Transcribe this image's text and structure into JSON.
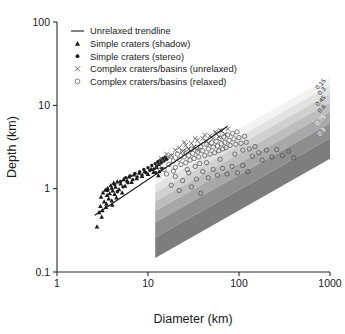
{
  "chart_data": {
    "type": "scatter",
    "title": "",
    "xlabel": "Diameter (km)",
    "ylabel": "Depth (km)",
    "xscale": "log",
    "yscale": "log",
    "xlim": [
      1,
      1000
    ],
    "ylim": [
      0.1,
      100
    ],
    "xticks": [
      "1",
      "10",
      "100",
      "1000"
    ],
    "yticks": [
      "0.1",
      "1",
      "10",
      "100"
    ],
    "grid": false,
    "legend_position": "top-left",
    "legend": [
      {
        "marker": "line",
        "label": "Unrelaxed trendline"
      },
      {
        "marker": "triangle",
        "label": "Simple craters (shadow)"
      },
      {
        "marker": "circle-fill",
        "label": "Simple craters (stereo)"
      },
      {
        "marker": "cross",
        "label": "Complex craters/basins (unrelaxed)"
      },
      {
        "marker": "circle-open",
        "label": "Complex craters/basins (relaxed)"
      }
    ],
    "band_labels": [
      "0.15",
      "0.3",
      "0.45",
      "0.6",
      "0.75",
      "0.9"
    ],
    "band_colors": [
      "#f2f2f2",
      "#e2e2e2",
      "#d0d0d0",
      "#bdbdbd",
      "#a8a8a8",
      "#8e8e8e",
      "#7d7d7d"
    ],
    "band_region": {
      "x_start": 12,
      "x_end": 1000,
      "note": "relaxation-state wedge"
    },
    "trendline": {
      "x": [
        2.6,
        75
      ],
      "y": [
        0.48,
        5.6
      ]
    },
    "series": [
      {
        "name": "Simple craters (shadow)",
        "marker": "triangle",
        "points": [
          [
            2.75,
            0.35
          ],
          [
            2.9,
            0.52
          ],
          [
            3.0,
            0.62
          ],
          [
            3.05,
            0.8
          ],
          [
            3.1,
            0.46
          ],
          [
            3.2,
            0.9
          ],
          [
            3.3,
            0.7
          ],
          [
            3.4,
            0.97
          ],
          [
            3.5,
            0.66
          ],
          [
            3.55,
            0.84
          ],
          [
            3.6,
            1.02
          ],
          [
            3.7,
            0.76
          ],
          [
            3.8,
            0.88
          ],
          [
            3.9,
            1.1
          ],
          [
            4.0,
            0.72
          ],
          [
            4.1,
            0.95
          ],
          [
            4.2,
            1.18
          ],
          [
            4.3,
            0.86
          ],
          [
            4.4,
            1.05
          ],
          [
            4.5,
            0.78
          ],
          [
            4.6,
            1.22
          ],
          [
            4.8,
            0.98
          ],
          [
            5.0,
            1.15
          ],
          [
            5.2,
            0.9
          ],
          [
            5.4,
            1.3
          ],
          [
            5.6,
            1.08
          ],
          [
            5.9,
            1.25
          ],
          [
            6.2,
            1.4
          ],
          [
            6.6,
            1.2
          ],
          [
            7.0,
            1.48
          ],
          [
            7.5,
            1.33
          ],
          [
            8.0,
            1.55
          ],
          [
            8.6,
            1.42
          ],
          [
            9.2,
            1.62
          ],
          [
            10.0,
            1.5
          ],
          [
            10.8,
            1.72
          ],
          [
            11.5,
            1.58
          ],
          [
            12.5,
            1.8
          ],
          [
            13.0,
            1.45
          ],
          [
            3.15,
            0.55
          ],
          [
            3.45,
            0.6
          ],
          [
            4.05,
            0.64
          ]
        ]
      },
      {
        "name": "Simple craters (stereo)",
        "marker": "circle-fill",
        "points": [
          [
            3.6,
            0.95
          ],
          [
            4.0,
            1.0
          ],
          [
            4.3,
            1.12
          ],
          [
            4.6,
            0.92
          ],
          [
            5.0,
            1.22
          ],
          [
            5.3,
            1.05
          ],
          [
            5.7,
            1.35
          ],
          [
            6.0,
            1.18
          ],
          [
            6.4,
            1.42
          ],
          [
            6.8,
            1.28
          ],
          [
            7.2,
            1.52
          ],
          [
            7.6,
            1.38
          ],
          [
            8.1,
            1.6
          ],
          [
            8.6,
            1.46
          ],
          [
            9.0,
            1.7
          ],
          [
            9.5,
            1.55
          ],
          [
            10.0,
            1.78
          ],
          [
            10.5,
            1.65
          ],
          [
            11.0,
            1.9
          ],
          [
            11.6,
            1.72
          ],
          [
            12.0,
            2.0
          ],
          [
            12.4,
            1.85
          ],
          [
            12.8,
            2.1
          ],
          [
            13.2,
            1.95
          ],
          [
            13.6,
            2.2
          ],
          [
            14.0,
            2.05
          ],
          [
            14.5,
            2.3
          ],
          [
            15.0,
            2.15
          ],
          [
            15.5,
            2.38
          ],
          [
            16.0,
            2.25
          ],
          [
            13.4,
            1.6
          ],
          [
            14.2,
            1.75
          ],
          [
            12.2,
            1.55
          ]
        ]
      },
      {
        "name": "Complex craters/basins (unrelaxed)",
        "marker": "cross",
        "points": [
          [
            14,
            2.3
          ],
          [
            16,
            2.6
          ],
          [
            18,
            2.5
          ],
          [
            20,
            2.9
          ],
          [
            22,
            3.1
          ],
          [
            24,
            2.8
          ],
          [
            26,
            3.3
          ],
          [
            28,
            3.0
          ],
          [
            30,
            3.5
          ],
          [
            32,
            3.2
          ],
          [
            35,
            3.8
          ],
          [
            38,
            3.4
          ],
          [
            40,
            4.0
          ],
          [
            44,
            3.7
          ],
          [
            48,
            4.3
          ],
          [
            52,
            4.0
          ],
          [
            56,
            4.6
          ],
          [
            60,
            4.2
          ],
          [
            65,
            4.9
          ],
          [
            70,
            4.5
          ],
          [
            75,
            5.2
          ],
          [
            25,
            3.6
          ],
          [
            33,
            4.0
          ],
          [
            42,
            4.4
          ],
          [
            55,
            4.8
          ],
          [
            62,
            5.0
          ],
          [
            36,
            2.9
          ],
          [
            46,
            3.5
          ]
        ]
      },
      {
        "name": "Complex craters/basins (relaxed)",
        "marker": "circle-open",
        "points": [
          [
            13,
            1.85
          ],
          [
            14,
            2.1
          ],
          [
            15,
            1.7
          ],
          [
            16,
            2.3
          ],
          [
            17,
            1.95
          ],
          [
            18,
            2.45
          ],
          [
            19,
            2.15
          ],
          [
            20,
            1.8
          ],
          [
            21,
            2.6
          ],
          [
            22,
            2.25
          ],
          [
            23,
            1.95
          ],
          [
            24,
            2.75
          ],
          [
            25,
            2.4
          ],
          [
            26,
            2.05
          ],
          [
            27,
            2.9
          ],
          [
            28,
            2.5
          ],
          [
            29,
            2.2
          ],
          [
            30,
            3.0
          ],
          [
            31,
            2.65
          ],
          [
            32,
            2.3
          ],
          [
            33,
            1.85
          ],
          [
            34,
            3.1
          ],
          [
            35,
            2.75
          ],
          [
            36,
            2.4
          ],
          [
            37,
            2.0
          ],
          [
            38,
            3.2
          ],
          [
            40,
            2.85
          ],
          [
            42,
            2.5
          ],
          [
            44,
            3.4
          ],
          [
            46,
            3.0
          ],
          [
            48,
            2.6
          ],
          [
            50,
            3.55
          ],
          [
            52,
            3.15
          ],
          [
            54,
            2.7
          ],
          [
            56,
            3.7
          ],
          [
            58,
            3.25
          ],
          [
            60,
            2.85
          ],
          [
            62,
            4.0
          ],
          [
            64,
            3.45
          ],
          [
            66,
            3.0
          ],
          [
            68,
            4.2
          ],
          [
            70,
            3.6
          ],
          [
            72,
            3.1
          ],
          [
            75,
            4.4
          ],
          [
            78,
            3.8
          ],
          [
            80,
            3.3
          ],
          [
            85,
            4.6
          ],
          [
            88,
            3.95
          ],
          [
            92,
            3.4
          ],
          [
            95,
            4.8
          ],
          [
            100,
            4.1
          ],
          [
            105,
            3.5
          ],
          [
            110,
            2.9
          ],
          [
            115,
            4.25
          ],
          [
            120,
            3.6
          ],
          [
            130,
            3.0
          ],
          [
            140,
            2.45
          ],
          [
            150,
            3.2
          ],
          [
            165,
            2.7
          ],
          [
            180,
            2.2
          ],
          [
            200,
            2.9
          ],
          [
            230,
            2.4
          ],
          [
            260,
            2.95
          ],
          [
            300,
            2.5
          ],
          [
            350,
            2.8
          ],
          [
            400,
            2.35
          ],
          [
            20,
            1.4
          ],
          [
            24,
            1.25
          ],
          [
            28,
            1.55
          ],
          [
            34,
            1.3
          ],
          [
            40,
            1.6
          ],
          [
            46,
            1.35
          ],
          [
            52,
            1.7
          ],
          [
            58,
            1.45
          ],
          [
            66,
            1.75
          ],
          [
            74,
            1.5
          ],
          [
            84,
            1.85
          ],
          [
            96,
            1.55
          ],
          [
            110,
            1.9
          ],
          [
            125,
            1.6
          ],
          [
            22,
            0.95
          ],
          [
            30,
            1.05
          ],
          [
            38,
            0.88
          ],
          [
            18,
            1.1
          ],
          [
            27,
            1.7
          ],
          [
            44,
            2.05
          ],
          [
            62,
            2.25
          ],
          [
            90,
            2.6
          ],
          [
            16,
            1.5
          ],
          [
            19,
            1.62
          ]
        ]
      }
    ]
  }
}
